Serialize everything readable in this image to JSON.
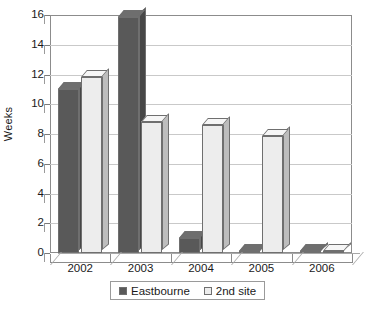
{
  "chart_data": {
    "type": "bar",
    "title": "",
    "subtitle": "",
    "xlabel": "",
    "ylabel": "Weeks",
    "categories": [
      "2002",
      "2003",
      "2004",
      "2005",
      "2006"
    ],
    "series": [
      {
        "name": "Eastbourne",
        "color": "#595959",
        "values": [
          11,
          15.9,
          1,
          0,
          0
        ]
      },
      {
        "name": "2nd site",
        "color": "#ededed",
        "values": [
          11.8,
          8.8,
          8.6,
          7.9,
          0
        ]
      }
    ],
    "ylim": [
      0,
      16
    ],
    "y_ticks": [
      0,
      2,
      4,
      6,
      8,
      10,
      12,
      14,
      16
    ],
    "y_tick_labels": [
      "0",
      "2",
      "4",
      "6",
      "8",
      "10",
      "12",
      "14",
      "16"
    ],
    "grid": true,
    "grid_axis": "y",
    "legend": {
      "position": "bottom",
      "entries": [
        "Eastbourne",
        "2nd site"
      ]
    },
    "style": "3d-clustered-column"
  },
  "axes": {
    "y_title": "Weeks"
  },
  "legend": {
    "items": [
      {
        "label": "Eastbourne",
        "swatch": "dark"
      },
      {
        "label": "2nd site",
        "swatch": "light"
      }
    ]
  }
}
